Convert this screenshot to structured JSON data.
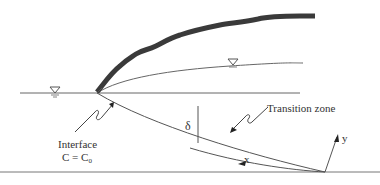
{
  "diagram": {
    "type": "coastal-aquifer-saltwater-interface",
    "labels": {
      "interface_line1": "Interface",
      "interface_line2": "C = C",
      "interface_subscript": "0",
      "transition_zone": "Transition zone",
      "delta": "δ",
      "x_axis": "x",
      "y_axis": "y"
    },
    "symbols": {
      "sea_level_marker": "water-level-triangle",
      "water_table_marker": "water-level-triangle"
    },
    "colors": {
      "line": "#555555",
      "ground_surface": "#3a3a3a",
      "text": "#333333",
      "background": "#ffffff"
    }
  }
}
